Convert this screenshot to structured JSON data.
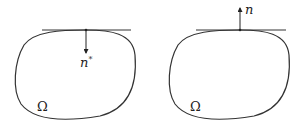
{
  "figures": [
    {
      "id": "left",
      "normal_label": "n",
      "normal_superscript": "*",
      "normal_direction": "inward",
      "region_label": "Ω"
    },
    {
      "id": "right",
      "normal_label": "n",
      "normal_superscript": "",
      "normal_direction": "outward",
      "region_label": "Ω"
    }
  ],
  "colors": {
    "stroke": "#333333",
    "background": "#ffffff"
  }
}
